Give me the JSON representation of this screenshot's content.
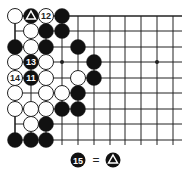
{
  "diagram": {
    "type": "go-board-fragment",
    "grid": {
      "col_x": [
        15,
        31,
        46,
        62,
        78,
        94,
        110,
        125,
        141,
        157,
        173
      ],
      "row_y": [
        16,
        31,
        47,
        62,
        78,
        93,
        109,
        124,
        140
      ],
      "right_edge_x": 182,
      "top_edge": true,
      "left_edge": true,
      "line_color": "#222222",
      "star_points": [
        [
          3,
          3
        ],
        [
          9,
          3
        ]
      ]
    },
    "stone_radius": 7.5,
    "colors": {
      "black": "#111111",
      "white": "#ffffff",
      "outline": "#222222"
    },
    "stones": [
      {
        "c": 0,
        "r": 0,
        "color": "white"
      },
      {
        "c": 1,
        "r": 0,
        "color": "black",
        "mark": "triangle"
      },
      {
        "c": 2,
        "r": 0,
        "color": "white",
        "label": "12"
      },
      {
        "c": 3,
        "r": 0,
        "color": "black"
      },
      {
        "c": 1,
        "r": 1,
        "color": "white"
      },
      {
        "c": 2,
        "r": 1,
        "color": "black"
      },
      {
        "c": 3,
        "r": 1,
        "color": "black"
      },
      {
        "c": 0,
        "r": 2,
        "color": "black"
      },
      {
        "c": 1,
        "r": 2,
        "color": "white"
      },
      {
        "c": 2,
        "r": 2,
        "color": "black"
      },
      {
        "c": 4,
        "r": 2,
        "color": "black"
      },
      {
        "c": 0,
        "r": 3,
        "color": "white"
      },
      {
        "c": 1,
        "r": 3,
        "color": "black",
        "label": "13"
      },
      {
        "c": 2,
        "r": 3,
        "color": "white"
      },
      {
        "c": 5,
        "r": 3,
        "color": "black"
      },
      {
        "c": 0,
        "r": 4,
        "color": "white",
        "label": "14"
      },
      {
        "c": 1,
        "r": 4,
        "color": "black",
        "label": "11"
      },
      {
        "c": 2,
        "r": 4,
        "color": "white"
      },
      {
        "c": 4,
        "r": 4,
        "color": "white"
      },
      {
        "c": 5,
        "r": 4,
        "color": "black"
      },
      {
        "c": 0,
        "r": 5,
        "color": "white"
      },
      {
        "c": 2,
        "r": 5,
        "color": "white"
      },
      {
        "c": 3,
        "r": 5,
        "color": "white"
      },
      {
        "c": 4,
        "r": 5,
        "color": "black"
      },
      {
        "c": 0,
        "r": 6,
        "color": "white"
      },
      {
        "c": 1,
        "r": 6,
        "color": "white"
      },
      {
        "c": 2,
        "r": 6,
        "color": "white"
      },
      {
        "c": 3,
        "r": 6,
        "color": "black"
      },
      {
        "c": 4,
        "r": 6,
        "color": "black"
      },
      {
        "c": 1,
        "r": 7,
        "color": "white"
      },
      {
        "c": 2,
        "r": 7,
        "color": "black"
      },
      {
        "c": 0,
        "r": 8,
        "color": "black"
      },
      {
        "c": 1,
        "r": 8,
        "color": "black"
      },
      {
        "c": 2,
        "r": 8,
        "color": "black"
      }
    ],
    "caption": {
      "left_stone": {
        "color": "black",
        "label": "15"
      },
      "equals": "=",
      "right_stone": {
        "color": "black",
        "mark": "triangle"
      },
      "text": "15 = △"
    }
  }
}
